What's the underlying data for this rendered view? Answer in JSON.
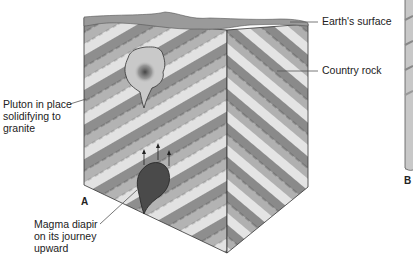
{
  "figure": {
    "panels": [
      {
        "id": "A",
        "label": "A"
      },
      {
        "id": "B",
        "label": "B"
      }
    ],
    "labels": {
      "earth_surface": "Earth's surface",
      "country_rock": "Country rock",
      "pluton": "Pluton in place\nsolidifying to\ngranite",
      "diapir": "Magma diapir\non its journey\nupward"
    },
    "colors": {
      "stripe_dark": "#8e8e8e",
      "stripe_mid": "#b3b3b3",
      "stripe_light": "#e2e2e2",
      "surface": "#9a9a9a",
      "pluton_fill": "#c9c9c9",
      "pluton_core": "#555555",
      "diapir": "#4a4a4a",
      "line": "#333333"
    }
  }
}
